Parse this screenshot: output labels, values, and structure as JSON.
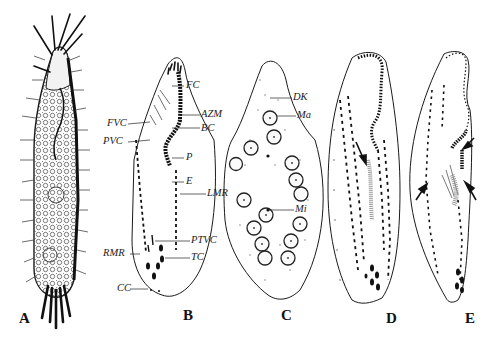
{
  "figure": {
    "type": "scientific-illustration",
    "panels": [
      {
        "id": "A",
        "label": "A",
        "description": "live specimen, lateral view with cirri and dense cytoplasmic granules"
      },
      {
        "id": "B",
        "label": "B",
        "description": "ciliature, ventral view, annotated",
        "annotations": [
          {
            "key": "FC",
            "text": "FC"
          },
          {
            "key": "AZM",
            "text": "AZM"
          },
          {
            "key": "BC",
            "text": "BC"
          },
          {
            "key": "FVC",
            "text": "FVC"
          },
          {
            "key": "PVC",
            "text": "PVC"
          },
          {
            "key": "P",
            "text": "P"
          },
          {
            "key": "E",
            "text": "E"
          },
          {
            "key": "LMR",
            "text": "LMR"
          },
          {
            "key": "PTVC",
            "text": "PTVC"
          },
          {
            "key": "RMR",
            "text": "RMR"
          },
          {
            "key": "TC",
            "text": "TC"
          },
          {
            "key": "CC",
            "text": "CC"
          }
        ]
      },
      {
        "id": "C",
        "label": "C",
        "description": "dorsal view showing kineties and nuclear apparatus",
        "annotations": [
          {
            "key": "DK",
            "text": "DK"
          },
          {
            "key": "Ma",
            "text": "Ma"
          },
          {
            "key": "Mi",
            "text": "Mi"
          }
        ]
      },
      {
        "id": "D",
        "label": "D",
        "description": "early divider, arrow marks oral primordium"
      },
      {
        "id": "E",
        "label": "E",
        "description": "middle divider, arrows mark primordia"
      }
    ]
  },
  "colors": {
    "ink": "#1a1a1a",
    "background": "#ffffff",
    "stipple": "#888888"
  }
}
